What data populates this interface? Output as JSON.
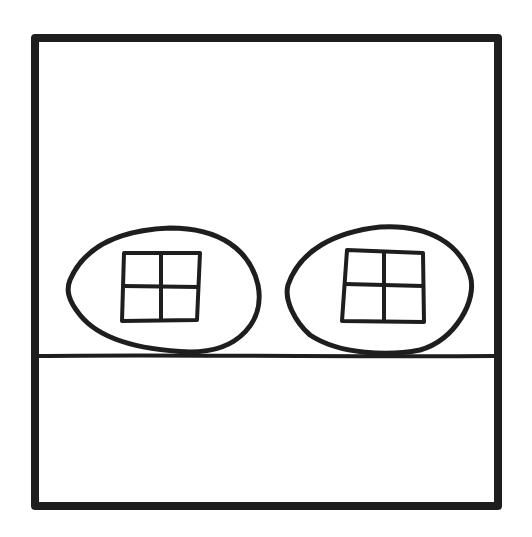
{
  "figure": {
    "type": "line-drawing",
    "stroke_color": "#1e1e1e",
    "background": "#ffffff",
    "frame": {
      "x": 31,
      "y": 34,
      "width": 471,
      "height": 476,
      "stroke_width": 8
    },
    "ground_line": {
      "y": 360,
      "stroke_width": 4
    },
    "objects": [
      {
        "name": "left-egg-house",
        "window": "four-pane"
      },
      {
        "name": "right-egg-house",
        "window": "four-pane"
      }
    ]
  },
  "caption": {
    "text": ""
  }
}
